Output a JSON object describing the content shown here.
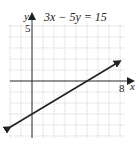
{
  "chart_data": {
    "type": "line",
    "title": "3x − 5y = 15",
    "xlabel": "x",
    "ylabel": "y",
    "tick_labels": {
      "x": [
        "8"
      ],
      "y": [
        "5"
      ]
    },
    "xlim": [
      -2,
      9
    ],
    "ylim": [
      -5,
      5
    ],
    "grid": true,
    "legend": null,
    "series": [
      {
        "name": "3x - 5y = 15",
        "equation": "y = (3/5)x - 3",
        "x": [
          -2,
          0,
          5,
          8
        ],
        "y": [
          -4.2,
          -3,
          0,
          1.8
        ],
        "arrows": "both"
      }
    ]
  },
  "labels": {
    "title": "3x − 5y = 15",
    "x_axis": "x",
    "y_axis": "y",
    "x_tick": "8",
    "y_tick": "5"
  },
  "colors": {
    "line": "#222222",
    "grid": "#b8b8b8",
    "axis": "#333333"
  }
}
